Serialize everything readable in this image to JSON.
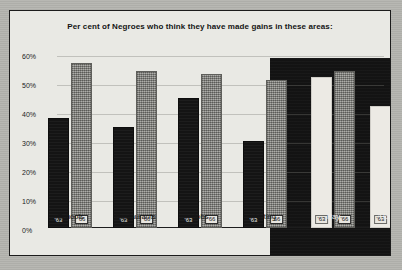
{
  "chart_data": {
    "type": "bar",
    "title": "Per cent of Negroes who think they have made gains in these areas:",
    "xlabel": "",
    "ylabel": "",
    "ylim": [
      0,
      60
    ],
    "ytick_labels": [
      "60%",
      "50%",
      "40%",
      "30%",
      "20%",
      "10%",
      "0%"
    ],
    "ytick_values": [
      60,
      50,
      40,
      30,
      20,
      10,
      0
    ],
    "grid": true,
    "legend_position": "in-bar",
    "categories": [
      "Schools",
      "Restaurants",
      "Jobs",
      "Voting",
      "Pay",
      "Housing"
    ],
    "series": [
      {
        "name": "'63",
        "values": [
          38,
          35,
          45,
          30,
          52,
          42
        ]
      },
      {
        "name": "'66",
        "values": [
          57,
          54,
          53,
          51,
          54,
          42
        ]
      }
    ],
    "groups": [
      {
        "category": "Schools",
        "panel": "light",
        "bars": [
          {
            "year": "'63",
            "value": 38,
            "style": "black"
          },
          {
            "year": "'66",
            "value": 57,
            "style": "gray"
          }
        ]
      },
      {
        "category": "Restaurants",
        "panel": "light",
        "bars": [
          {
            "year": "'63",
            "value": 35,
            "style": "black"
          },
          {
            "year": "'66",
            "value": 54,
            "style": "gray"
          }
        ]
      },
      {
        "category": "Jobs",
        "panel": "light",
        "bars": [
          {
            "year": "'63",
            "value": 45,
            "style": "black"
          },
          {
            "year": "'66",
            "value": 53,
            "style": "gray"
          }
        ]
      },
      {
        "category": "Voting",
        "panel": "light",
        "bars": [
          {
            "year": "'63",
            "value": 30,
            "style": "black"
          },
          {
            "year": "'66",
            "value": 51,
            "style": "gray"
          }
        ]
      },
      {
        "category": "Pay",
        "panel": "dark",
        "bars": [
          {
            "year": "'63",
            "value": 52,
            "style": "white"
          },
          {
            "year": "'66",
            "value": 54,
            "style": "gray"
          }
        ]
      },
      {
        "category": "Housing",
        "panel": "dark",
        "bars": [
          {
            "year": "'63",
            "value": 42,
            "style": "white"
          },
          {
            "year": "'66",
            "value": 42,
            "style": "gray"
          }
        ]
      }
    ],
    "annotations": {
      "housing_label_display": "'Housing"
    },
    "colors": {
      "bar_63_light_panel": "#141414",
      "bar_66_halftone": "#8d8d88",
      "bar_63_dark_panel": "#eceae4",
      "dark_panel_background": "#131313",
      "chart_background": "#e9e9e4",
      "page_background": "#b6b6b1",
      "frame_border": "#1c1c1c",
      "text": "#141414"
    }
  }
}
